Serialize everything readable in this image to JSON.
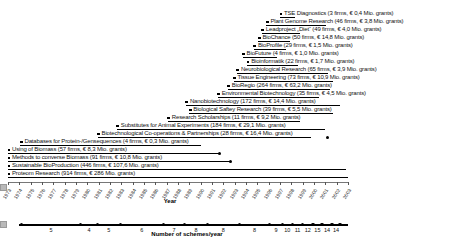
{
  "figure": {
    "year_axis_label": "Year",
    "schemes_axis_label": "Number of schemes/year"
  },
  "chart_data": [
    {
      "type": "bar",
      "subtype": "horizontal-timeline-gantt",
      "title": "",
      "xlabel": "Year",
      "axis": {
        "min_year": 1973,
        "max_year": 2003,
        "tick_step": 1
      },
      "tick_labels": [
        "1973",
        "1974",
        "1975",
        "1976",
        "1977",
        "1978",
        "1979",
        "1980",
        "1981",
        "1982",
        "1983",
        "1984",
        "1985",
        "1986",
        "1987",
        "1988",
        "1989",
        "1990",
        "1991",
        "1992",
        "1993",
        "1994",
        "1995",
        "1996",
        "1997",
        "1998",
        "1999",
        "2000",
        "2001",
        "2002",
        "2003"
      ],
      "schemes": [
        {
          "name": "TSE Diagnostics",
          "label": "TSE Diagnostics (3 firms, € 0,4 Mio. grants)",
          "firms": 3,
          "grants": "€ 0,4 Mio.",
          "start_year": 1997.0,
          "end_year": 1998.3,
          "end_dot_year": null
        },
        {
          "name": "Plant Genome Research",
          "label": "Plant Genome Research (46 firms, € 3,8 Mio. grants)",
          "firms": 46,
          "grants": "€ 3,8 Mio.",
          "start_year": 1995.8,
          "end_year": 2001.1,
          "end_dot_year": null
        },
        {
          "name": "Leadproject Diet",
          "label": "Leadproject „Diet“ (49 firms, € 4,0 Mio. grants)",
          "firms": 49,
          "grants": "€ 4,0 Mio.",
          "start_year": 1995.4,
          "end_year": 1998.8,
          "end_dot_year": null
        },
        {
          "name": "BioChance",
          "label": "BioChance (50 firms, € 14,8 Mio. grants)",
          "firms": 50,
          "grants": "€ 14,8 Mio.",
          "start_year": 1995.1,
          "end_year": 1997.9,
          "end_dot_year": null
        },
        {
          "name": "BioProfile",
          "label": "BioProfile (29 firms, € 1,5 Mio. grants)",
          "firms": 29,
          "grants": "€ 1,5 Mio.",
          "start_year": 1994.7,
          "end_year": 1997.5,
          "end_dot_year": null
        },
        {
          "name": "BioFuture",
          "label": "BioFuture (4 firms, € 1,0 Mio. grants)",
          "firms": 4,
          "grants": "€ 1,0 Mio.",
          "start_year": 1993.7,
          "end_year": 1996.7,
          "end_dot_year": null
        },
        {
          "name": "Bioinformatik",
          "label": "Bioinformatik (22 firms, € 1,7 Mio. grants)",
          "firms": 22,
          "grants": "€ 1,7 Mio.",
          "start_year": 1994.1,
          "end_year": 1998.6,
          "end_dot_year": null
        },
        {
          "name": "Neurobiological Research",
          "label": "Neurobiological Research (65 firms, € 3,9 Mio. grants)",
          "firms": 65,
          "grants": "€ 3,9 Mio.",
          "start_year": 1993.2,
          "end_year": 2001.2,
          "end_dot_year": null
        },
        {
          "name": "Tissue Engineering",
          "label": "Tissue Engineering (73 firms, € 10,9 Mio. grants)",
          "firms": 73,
          "grants": "€ 10,9 Mio.",
          "start_year": 1992.9,
          "end_year": 2001.7,
          "end_dot_year": null
        },
        {
          "name": "BioRegio",
          "label": "BioRegio (264 firms, € 63,2 Mio. grants)",
          "firms": 264,
          "grants": "€ 63,2 Mio.",
          "start_year": 1992.4,
          "end_year": 2001.4,
          "end_dot_year": null
        },
        {
          "name": "Environmental Biotechnology",
          "label": "Environmental Biotechnology (35 firms, € 4,5 Mio. grants)",
          "firms": 35,
          "grants": "€ 4,5 Mio.",
          "start_year": 1991.5,
          "end_year": 2000.4,
          "end_dot_year": null
        },
        {
          "name": "Nanobiotechnology",
          "label": "Nanobiotechnology (172 firms, € 14,4 Mio. grants)",
          "firms": 172,
          "grants": "€ 14,4 Mio.",
          "start_year": 1988.7,
          "end_year": 2002.3,
          "end_dot_year": null
        },
        {
          "name": "Biological Saftey Research",
          "label": "Biological Saftey Research (39 firms, € 5,5 Mio. grants)",
          "firms": 39,
          "grants": "€ 5,5 Mio.",
          "start_year": 1989.0,
          "end_year": 2001.7,
          "end_dot_year": null
        },
        {
          "name": "Research Scholarships",
          "label": "Research Scholarships (11 firms, € 9,2 Mio. grants)",
          "firms": 11,
          "grants": "€ 9,2 Mio.",
          "start_year": 1987.1,
          "end_year": 1998.8,
          "end_dot_year": null
        },
        {
          "name": "Substitutes for Animal Experiments",
          "label": "Substitutes for Animal Experiments (184 firms, € 29,1 Mio. grants)",
          "firms": 184,
          "grants": "€ 29,1 Mio.",
          "start_year": 1982.6,
          "end_year": 2001.0,
          "end_dot_year": null
        },
        {
          "name": "Biotechnological Co-operations & Partnerships",
          "label": "Biotechnological Co-operations & Partnerships (28 firms, € 16,4 Mio. grants)",
          "firms": 28,
          "grants": "€ 16,4 Mio.",
          "start_year": 1980.9,
          "end_year": 1999.7,
          "end_dot_year": 2001.2
        },
        {
          "name": "Databases for Protein-/Gensequences",
          "label": "Databases for Protein-/Gensequences (4 firms, € 0,3 Mio. grants)",
          "firms": 4,
          "grants": "€ 0,3 Mio.",
          "start_year": 1974.1,
          "end_year": 1990.0,
          "end_dot_year": null
        },
        {
          "name": "Using of Biomass",
          "label": "Using of Biomass (57 firms, € 8,3 Mio. grants)",
          "firms": 57,
          "grants": "€ 8,3 Mio.",
          "start_year": 1973.0,
          "end_year": 1991.7,
          "end_dot_year": 1991.7
        },
        {
          "name": "Methods to converse Biomass",
          "label": "Methods to converse Biomass (91 firms, € 10,8 Mio. grants)",
          "firms": 91,
          "grants": "€ 10,8 Mio.",
          "start_year": 1973.0,
          "end_year": 1992.6,
          "end_dot_year": 1992.6
        },
        {
          "name": "Sustainable BioProduction",
          "label": "Sustainable BioProduction (446 firms, € 107,6 Mio. grants)",
          "firms": 446,
          "grants": "€ 107,6 Mio.",
          "start_year": 1973.0,
          "end_year": 2002.8,
          "end_dot_year": null
        },
        {
          "name": "Proteom Research",
          "label": "Proteom Research (914 firms, € 286 Mio. grants)",
          "firms": 914,
          "grants": "€ 286 Mio.",
          "start_year": 1973.0,
          "end_year": 2003.0,
          "end_dot_year": null
        }
      ]
    },
    {
      "type": "bar",
      "subtype": "segmented-number-line",
      "xlabel": "Number of schemes/year",
      "line_start_year": 1974,
      "line_end_year": 2003,
      "boundary_years": [
        1974.2,
        1979.4,
        1980.9,
        1982.9,
        1986.7,
        1988.6,
        1990.6,
        1993.4,
        1996.1,
        1997.2,
        1998.1,
        1999.0,
        1999.9,
        2000.7,
        2001.6,
        2002.3
      ],
      "segment_values": [
        5,
        4,
        5,
        6,
        7,
        8,
        8,
        8,
        9,
        10,
        11,
        12,
        15,
        14,
        14
      ]
    }
  ]
}
